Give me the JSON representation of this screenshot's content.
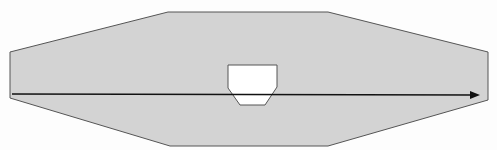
{
  "diagram": {
    "width": 497,
    "height": 150,
    "background": "#fdfdfd",
    "outer_shape": {
      "points": "10,52 168,12 328,12 488,52 488,100 328,146 170,146 10,98",
      "fill": "#d3d3d3",
      "stroke": "#555555"
    },
    "inner_cutout": {
      "points": "228,65 277,65 277,87 265,105 240,105 228,88",
      "fill": "#ffffff",
      "stroke": "#555555"
    },
    "arrow": {
      "x1": 12,
      "y1": 94,
      "x2": 480,
      "y2": 95,
      "color": "#111111",
      "head": "480,95 470,91 470,99"
    }
  }
}
